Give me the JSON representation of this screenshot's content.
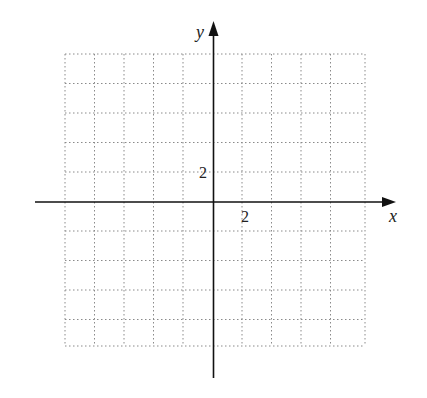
{
  "graph": {
    "x_axis_label": "x",
    "y_axis_label": "y",
    "x_tick_label": "2",
    "y_tick_label": "2",
    "grid": {
      "columns": 10,
      "rows": 10,
      "cell_size_px": 29.3,
      "style": "dotted",
      "color": "#888888"
    },
    "axis_color": "#111111"
  }
}
